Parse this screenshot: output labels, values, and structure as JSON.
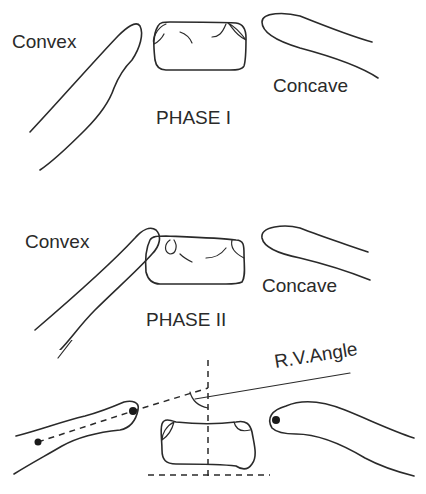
{
  "diagram": {
    "phase1": {
      "left_label": "Convex",
      "right_label": "Concave",
      "title": "PHASE I"
    },
    "phase2": {
      "left_label": "Convex",
      "right_label": "Concave",
      "title": "PHASE II"
    },
    "phase3": {
      "angle_label": "R.V.Angle"
    },
    "colors": {
      "ink": "#2a2a2a",
      "background": "#ffffff"
    }
  }
}
